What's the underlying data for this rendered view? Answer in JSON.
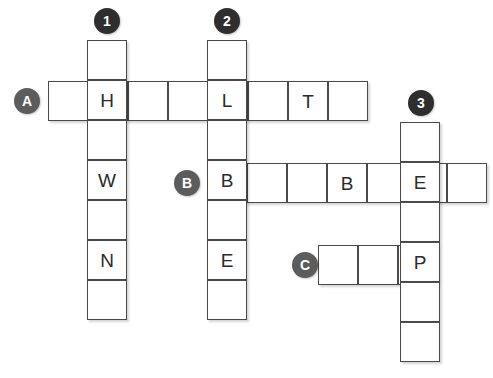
{
  "puzzle": {
    "title": "Crossword Grid",
    "cell_size": 40,
    "colors": {
      "cell_background": "#ffffff",
      "cell_border": "#4a4a4a",
      "marker_down": "#2e2e2e",
      "marker_across": "#5c5c5c",
      "marker_text": "#ffffff",
      "letter_text": "#2b2b2b",
      "page_background": "#ffffff"
    },
    "markers": {
      "down": [
        {
          "label": "1",
          "x": 94,
          "y": 8
        },
        {
          "label": "2",
          "x": 214,
          "y": 8
        },
        {
          "label": "3",
          "x": 408,
          "y": 90
        }
      ],
      "across": [
        {
          "label": "A",
          "x": 14,
          "y": 88
        },
        {
          "label": "B",
          "x": 174,
          "y": 170
        },
        {
          "label": "C",
          "x": 292,
          "y": 252
        }
      ]
    },
    "entries": {
      "down": [
        {
          "number": "1",
          "direction": "down",
          "x": 87,
          "y": 40,
          "length": 7,
          "letters": [
            "",
            "H",
            "",
            "W",
            "",
            "N",
            ""
          ]
        },
        {
          "number": "2",
          "direction": "down",
          "x": 207,
          "y": 40,
          "length": 7,
          "letters": [
            "",
            "L",
            "",
            "B",
            "",
            "E",
            ""
          ]
        },
        {
          "number": "3",
          "direction": "down",
          "x": 400,
          "y": 122,
          "length": 6,
          "letters": [
            "",
            "E",
            "",
            "P",
            "",
            ""
          ]
        }
      ],
      "across": [
        {
          "number": "A",
          "direction": "across",
          "x": 48,
          "y": 81,
          "length": 8,
          "letters": [
            "",
            "H",
            "",
            "",
            "L",
            "",
            "T",
            ""
          ]
        },
        {
          "number": "B",
          "direction": "across",
          "x": 207,
          "y": 163,
          "length": 7,
          "letters": [
            "B",
            "",
            "",
            "B",
            "",
            "E",
            ""
          ]
        },
        {
          "number": "C",
          "direction": "across",
          "x": 318,
          "y": 245,
          "length": 3,
          "letters": [
            "",
            "",
            "P"
          ]
        }
      ]
    }
  }
}
